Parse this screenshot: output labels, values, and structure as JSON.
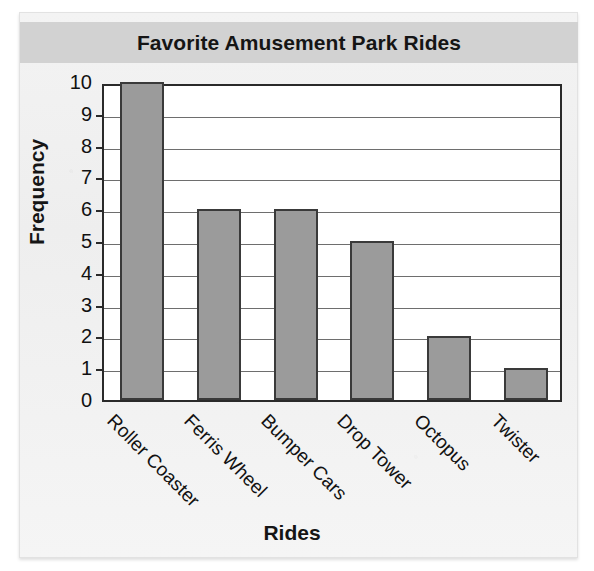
{
  "chart_data": {
    "type": "bar",
    "title": "Favorite Amusement Park Rides",
    "xlabel": "Rides",
    "ylabel": "Frequency",
    "categories": [
      "Roller Coaster",
      "Ferris Wheel",
      "Bumper Cars",
      "Drop Tower",
      "Octopus",
      "Twister"
    ],
    "values": [
      10,
      6,
      6,
      5,
      2,
      1
    ],
    "ylim": [
      0,
      10
    ],
    "ytick_labels": [
      "10",
      "9",
      "8",
      "7",
      "6",
      "5",
      "4",
      "3",
      "2",
      "1",
      "0"
    ],
    "ytick_values": [
      10,
      9,
      8,
      7,
      6,
      5,
      4,
      3,
      2,
      1,
      0
    ],
    "grid": true,
    "legend": "none",
    "bar_color": "#9b9b9b",
    "bar_border_color": "#3a3a3a",
    "title_band_color": "#d2d2d2",
    "plot_background": "#ffffff",
    "axis_color": "#2a2a2a"
  }
}
